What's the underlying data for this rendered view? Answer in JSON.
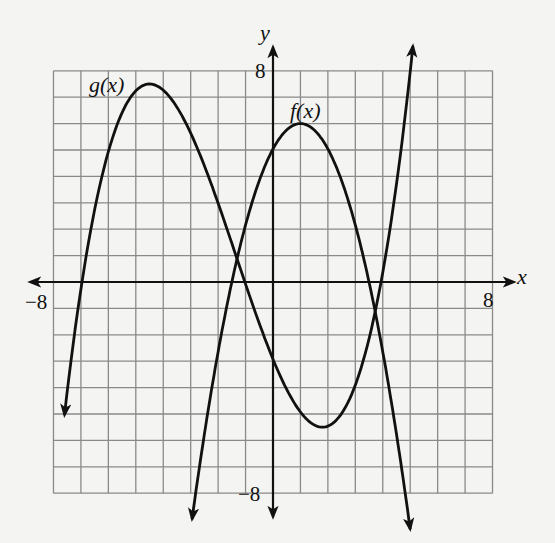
{
  "chart_data": {
    "type": "line",
    "title": "",
    "xlabel": "x",
    "ylabel": "y",
    "xlim": [
      -8,
      8
    ],
    "ylim": [
      -8,
      8
    ],
    "grid": true,
    "grid_step": 1,
    "tick_labels": {
      "x": [
        {
          "value": -8,
          "label": "−8"
        },
        {
          "value": 8,
          "label": "8"
        }
      ],
      "y": [
        {
          "value": 8,
          "label": "8"
        },
        {
          "value": -8,
          "label": "−8"
        }
      ]
    },
    "legend": null,
    "series": [
      {
        "name": "g(x)",
        "shape": "cubic, positive leading coefficient",
        "end_behavior": "arrow down on left, arrow up on right",
        "key_points": {
          "local_max": [
            -4.5,
            7.5
          ],
          "local_min": [
            1.8,
            -5.5
          ],
          "x_intercepts": [
            -7.0,
            -0.9,
            3.9
          ],
          "left_end": [
            -7.6,
            -4.0
          ],
          "right_end": [
            5.1,
            7.7
          ]
        },
        "label_position": [
          -6.4,
          7.2
        ]
      },
      {
        "name": "f(x)",
        "shape": "downward-opening parabola",
        "end_behavior": "arrows down on both ends",
        "key_points": {
          "vertex": [
            1.0,
            6.0
          ],
          "x_intercepts": [
            -1.5,
            3.5
          ],
          "left_end": [
            -2.95,
            -8.9
          ],
          "right_end": [
            5.0,
            -8.9
          ]
        },
        "label_position": [
          1.0,
          6.5
        ]
      }
    ],
    "intersections": [
      [
        -1.3,
        1.2
      ],
      [
        3.7,
        -1.0
      ]
    ]
  },
  "labels": {
    "x_axis": "x",
    "y_axis": "y",
    "x_min": "−8",
    "x_max": "8",
    "y_max": "8",
    "y_min": "−8",
    "g_label": "g(x)",
    "f_label": "f(x)"
  },
  "colors": {
    "background": "#f4f4f2",
    "grid": "#8a8a8a",
    "axis": "#111111",
    "curve": "#111111"
  }
}
